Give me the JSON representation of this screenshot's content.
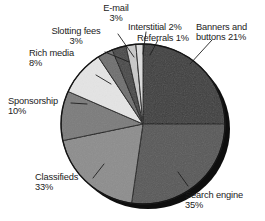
{
  "chart_data": {
    "type": "pie",
    "title": "",
    "subtitle": "",
    "xlabel": "",
    "ylabel": "",
    "legend_position": "none",
    "grid": false,
    "value_unit": "%",
    "labels_include_percent": true,
    "categories": [
      "Banners and buttons",
      "Search engine",
      "Classifieds",
      "Sponsorship",
      "Rich media",
      "Slotting fees",
      "E-mail",
      "Interstitial",
      "Referrals"
    ],
    "values": [
      21,
      35,
      33,
      10,
      8,
      3,
      3,
      2,
      1
    ],
    "slices": [
      {
        "name": "Banners and buttons",
        "value": 21,
        "value_text": "21%",
        "label_line1": "Banners and",
        "label_line2": "buttons 21%",
        "color": "#3e3e3e",
        "start_deg": 0,
        "end_deg": 90
      },
      {
        "name": "Search engine",
        "value": 35,
        "value_text": "35%",
        "label_line1": "Search engine",
        "label_line2": "35%",
        "color": "#585858",
        "start_deg": 90,
        "end_deg": 188
      },
      {
        "name": "Classifieds",
        "value": 33,
        "value_text": "33%",
        "label_line1": "Classifieds",
        "label_line2": "33%",
        "color": "#8d8d8d",
        "start_deg": 188,
        "end_deg": 258
      },
      {
        "name": "Sponsorship",
        "value": 10,
        "value_text": "10%",
        "label_line1": "Sponsorship",
        "label_line2": "10%",
        "color": "#7b7b7b",
        "start_deg": 258,
        "end_deg": 294
      },
      {
        "name": "Rich media",
        "value": 8,
        "value_text": "8%",
        "label_line1": "Rich media",
        "label_line2": "8%",
        "color": "#e4e4e4",
        "start_deg": 294,
        "end_deg": 327
      },
      {
        "name": "Slotting fees",
        "value": 3,
        "value_text": "3%",
        "label_line1": "Slotting fees",
        "label_line2": "3%",
        "color": "#6f6f6f",
        "start_deg": 327,
        "end_deg": 338
      },
      {
        "name": "E-mail",
        "value": 3,
        "value_text": "3%",
        "label_line1": "E-mail",
        "label_line2": "3%",
        "color": "#484848",
        "start_deg": 338,
        "end_deg": 348
      },
      {
        "name": "Interstitial",
        "value": 2,
        "value_text": "2%",
        "label_line1": "Interstitial 2%",
        "label_line2": "",
        "color": "#c9c9c9",
        "start_deg": 348,
        "end_deg": 355
      },
      {
        "name": "Referrals",
        "value": 1,
        "value_text": "1%",
        "label_line1": "Referrals 1%",
        "label_line2": "",
        "color": "#dcdcdc",
        "start_deg": 355,
        "end_deg": 360
      }
    ],
    "colors": {
      "background": "#ffffff",
      "text": "#1b1b1b",
      "outline": "#1a1a1a",
      "shadow": "#0d0d0d"
    }
  },
  "labels": {
    "email": {
      "line1": "E-mail",
      "line2": "3%"
    },
    "slotting": {
      "line1": "Slotting fees",
      "line2": "3%"
    },
    "richmedia": {
      "line1": "Rich media",
      "line2": "8%"
    },
    "sponsorship": {
      "line1": "Sponsorship",
      "line2": "10%"
    },
    "classifieds": {
      "line1": "Classifieds",
      "line2": "33%"
    },
    "interstitial": {
      "line1": "Interstitial 2%"
    },
    "referrals": {
      "line1": "Referrals 1%"
    },
    "banners": {
      "line1": "Banners and",
      "line2": "buttons 21%"
    },
    "searchengine": {
      "line1": "Search engine",
      "line2": "35%"
    }
  }
}
